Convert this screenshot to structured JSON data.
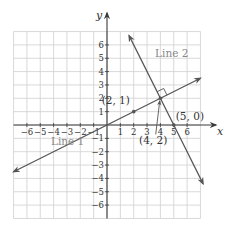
{
  "figure": {
    "title": "",
    "axes": {
      "x_label": "x",
      "y_label": "y",
      "x_range": [
        -7,
        7
      ],
      "y_range": [
        -7,
        7
      ],
      "x_ticks": [
        -6,
        -5,
        -4,
        -3,
        -2,
        -1,
        1,
        2,
        3,
        4,
        5,
        6
      ],
      "y_ticks": [
        -6,
        -5,
        -4,
        -3,
        -2,
        -1,
        1,
        2,
        3,
        4,
        5,
        6
      ],
      "x_tick_labels": [
        "−6",
        "−5",
        "−4",
        "−3",
        "−2",
        "−1",
        "1",
        "2",
        "3",
        "4",
        "5",
        "6"
      ],
      "y_tick_labels": [
        "−6",
        "−5",
        "−4",
        "−3",
        "−2",
        "−1",
        "1",
        "2",
        "3",
        "4",
        "5",
        "6"
      ],
      "grid": true
    },
    "lines": [
      {
        "name": "Line 1",
        "label": "Line 1",
        "slope": 0.5,
        "intercept": 0,
        "from": [
          -7,
          -3.5
        ],
        "to": [
          7,
          3.5
        ],
        "label_pos": [
          -4.2,
          -1.5
        ]
      },
      {
        "name": "Line 2",
        "label": "Line 2",
        "slope": -2,
        "intercept": 10,
        "from": [
          1.65,
          6.7
        ],
        "to": [
          7.2,
          -4.4
        ],
        "label_pos": [
          3.6,
          5.1
        ]
      }
    ],
    "points": [
      {
        "label": "(2, 1)",
        "x": 2,
        "y": 1,
        "label_pos": [
          -0.4,
          1.55
        ]
      },
      {
        "label": "(4, 2)",
        "x": 4,
        "y": 2,
        "label_pos": [
          2.4,
          -1.45
        ],
        "pointer": true
      },
      {
        "label": "(5, 0)",
        "x": 5,
        "y": 0,
        "label_pos": [
          5.15,
          0.35
        ]
      }
    ],
    "right_angle_at": [
      4,
      2
    ],
    "colors": {
      "grid": "#cfcfcf",
      "axis": "#3a3a3a",
      "line": "#555555",
      "line_label": "#8a8a8a",
      "text": "#333333"
    }
  },
  "chart_data": {
    "type": "line",
    "title": "",
    "xlabel": "x",
    "ylabel": "y",
    "xlim": [
      -7,
      7
    ],
    "ylim": [
      -7,
      7
    ],
    "grid": true,
    "series": [
      {
        "name": "Line 1",
        "equation": "y = x/2",
        "points": [
          [
            0,
            0
          ],
          [
            2,
            1
          ],
          [
            4,
            2
          ]
        ]
      },
      {
        "name": "Line 2",
        "equation": "y = -2x + 10",
        "points": [
          [
            4,
            2
          ],
          [
            5,
            0
          ]
        ]
      }
    ],
    "annotations": [
      "(2, 1)",
      "(4, 2)",
      "(5, 0)",
      "Line 1",
      "Line 2",
      "right angle at (4, 2)"
    ]
  }
}
